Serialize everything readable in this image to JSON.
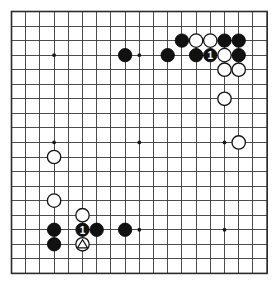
{
  "figure": {
    "type": "go-board-diagram",
    "board_size": 19,
    "background_color": "#ffffff",
    "line_color": "#3a3a3a",
    "border_color": "#2a2a2a",
    "black_color": "#111111",
    "white_color": "#ffffff"
  },
  "geometry": {
    "origin_x": 11.5,
    "origin_y": 11.5,
    "step_x": 14.2,
    "step_y": 14.55,
    "lines": 19,
    "stone_radius": 6.7,
    "star_radius": 1.9
  },
  "star_points": [
    {
      "col": 3,
      "row": 3
    },
    {
      "col": 9,
      "row": 3
    },
    {
      "col": 15,
      "row": 3
    },
    {
      "col": 3,
      "row": 9
    },
    {
      "col": 9,
      "row": 9
    },
    {
      "col": 15,
      "row": 9
    },
    {
      "col": 3,
      "row": 15
    },
    {
      "col": 9,
      "row": 15
    },
    {
      "col": 15,
      "row": 15
    }
  ],
  "stones": [
    {
      "col": 12,
      "row": 2,
      "color": "black",
      "label": ""
    },
    {
      "col": 13,
      "row": 2,
      "color": "white",
      "label": ""
    },
    {
      "col": 14,
      "row": 2,
      "color": "white",
      "label": ""
    },
    {
      "col": 15,
      "row": 2,
      "color": "black",
      "label": ""
    },
    {
      "col": 16,
      "row": 2,
      "color": "black",
      "label": ""
    },
    {
      "col": 8,
      "row": 3,
      "color": "black",
      "label": ""
    },
    {
      "col": 11,
      "row": 3,
      "color": "black",
      "label": ""
    },
    {
      "col": 13,
      "row": 3,
      "color": "black",
      "label": ""
    },
    {
      "col": 14,
      "row": 3,
      "color": "black",
      "label": "1"
    },
    {
      "col": 15,
      "row": 3,
      "color": "white",
      "label": ""
    },
    {
      "col": 16,
      "row": 3,
      "color": "black",
      "label": ""
    },
    {
      "col": 15,
      "row": 4,
      "color": "white",
      "label": ""
    },
    {
      "col": 16,
      "row": 4,
      "color": "white",
      "label": ""
    },
    {
      "col": 15,
      "row": 6,
      "color": "white",
      "label": ""
    },
    {
      "col": 16,
      "row": 9,
      "color": "white",
      "label": ""
    },
    {
      "col": 3,
      "row": 10,
      "color": "white",
      "label": ""
    },
    {
      "col": 3,
      "row": 13,
      "color": "white",
      "label": ""
    },
    {
      "col": 5,
      "row": 14,
      "color": "white",
      "label": ""
    },
    {
      "col": 3,
      "row": 15,
      "color": "black",
      "label": ""
    },
    {
      "col": 5,
      "row": 15,
      "color": "black",
      "label": "1"
    },
    {
      "col": 6,
      "row": 15,
      "color": "black",
      "label": ""
    },
    {
      "col": 8,
      "row": 15,
      "color": "black",
      "label": ""
    },
    {
      "col": 3,
      "row": 16,
      "color": "black",
      "label": ""
    },
    {
      "col": 5,
      "row": 16,
      "color": "white",
      "label": "triangle"
    }
  ]
}
